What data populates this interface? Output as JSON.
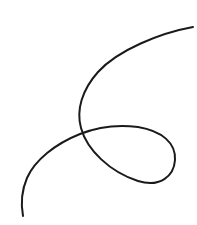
{
  "canvas": {
    "width": 197,
    "height": 225,
    "background": "#ffffff"
  },
  "drawing": {
    "description": "hand-drawn looping curve",
    "stroke_color": "#1a1a1a",
    "stroke_width": 2,
    "path": "M193,27 C160,33 118,50 98,72 C82,90 76,110 81,128 C87,150 110,172 138,181 C160,188 174,176 175,160 C176,143 162,131 138,127 C115,124 95,128 80,134 C55,144 35,160 27,178 C21,192 21,205 23,216"
  }
}
